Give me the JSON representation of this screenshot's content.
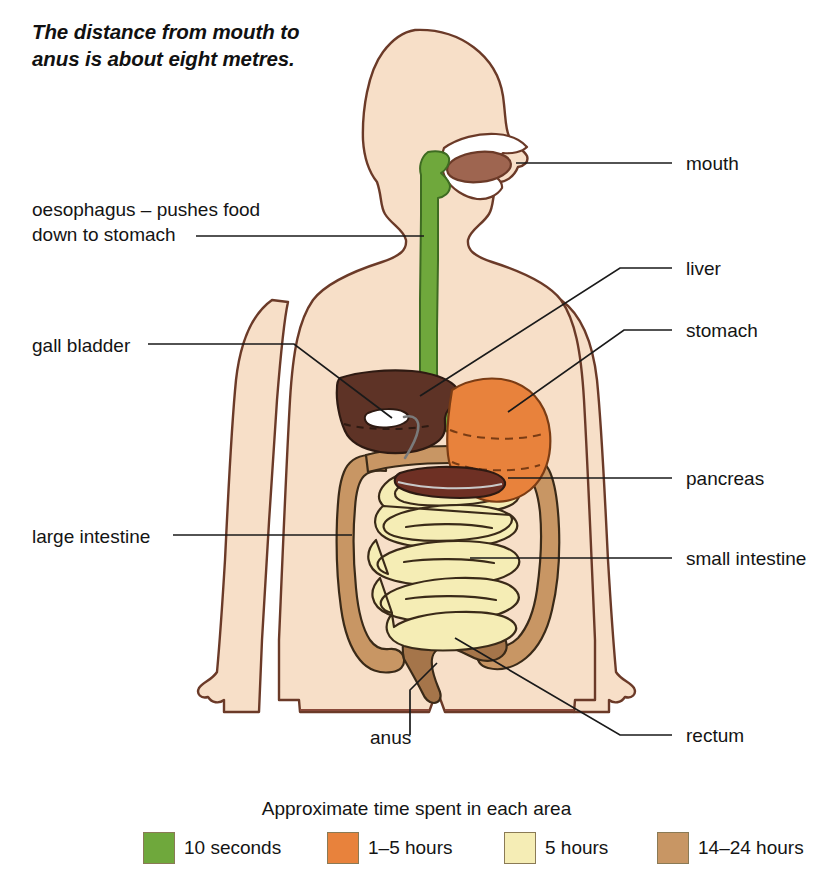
{
  "note": {
    "line1": "The distance from mouth to",
    "line2": "anus is about eight metres."
  },
  "labels": {
    "oesophagus_l1": "oesophagus – pushes food",
    "oesophagus_l2": "down to stomach",
    "gall_bladder": "gall bladder",
    "large_intestine": "large intestine",
    "anus": "anus",
    "mouth": "mouth",
    "liver": "liver",
    "stomach": "stomach",
    "pancreas": "pancreas",
    "small_intestine": "small intestine",
    "rectum": "rectum"
  },
  "legend": {
    "title": "Approximate time spent in each area",
    "items": [
      {
        "label": "10 seconds",
        "color": "#6FA83C"
      },
      {
        "label": "1–5 hours",
        "color": "#E8823C"
      },
      {
        "label": "5 hours",
        "color": "#F5EDB5"
      },
      {
        "label": "14–24 hours",
        "color": "#C89664"
      }
    ]
  },
  "palette": {
    "skin": "#F7DFC8",
    "outline": "#6B3A28",
    "oesophagus": "#6FA83C",
    "stomach": "#E8823C",
    "liver": "#6B3A28",
    "liver_fill": "#5E3326",
    "gall_bladder": "#FFFFFF",
    "pancreas": "#6E3024",
    "small_intestine": "#F5EDB5",
    "large_intestine": "#C89664",
    "tongue": "#9E6550",
    "leader": "#1a1a1a"
  }
}
